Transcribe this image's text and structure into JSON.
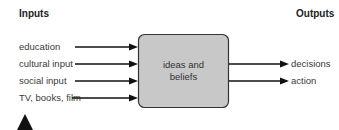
{
  "headings": {
    "inputs": "Inputs",
    "outputs": "Outputs"
  },
  "inputs": [
    "education",
    "cultural input",
    "social input",
    "TV, books, film"
  ],
  "center_box": {
    "line1": "ideas and",
    "line2": "beliefs",
    "fill": "#c8c8c8"
  },
  "outputs": [
    "decisions",
    "action"
  ],
  "colors": {
    "arrow": "#111111",
    "text": "#3a3a3a"
  }
}
